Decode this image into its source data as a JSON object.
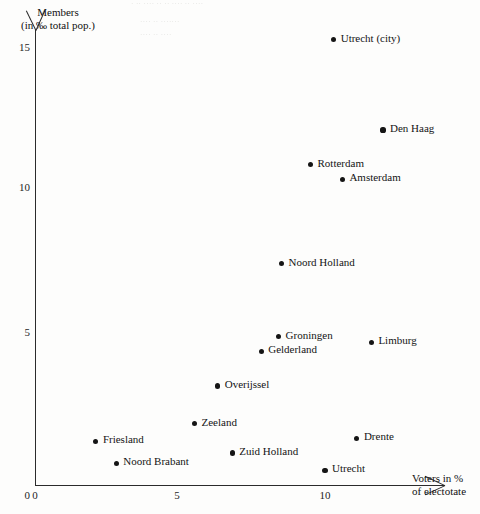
{
  "figure": {
    "background_color": "#fdfdfc",
    "ink_color": "#151515",
    "bleed_through_lines": [
      "· ·· ···· ·· ·· ···· ·· ····",
      "···· ·· ·······",
      "···· ·· ····"
    ]
  },
  "axes": {
    "y": {
      "title_line1": "Members",
      "title_line2": "(in ‰ total pop.)",
      "ticks": [
        "0",
        "5",
        "10",
        "15"
      ],
      "range": [
        0,
        15.8
      ]
    },
    "x": {
      "title_line1": "Voters in %",
      "title_line2": "of electotate",
      "ticks": [
        "0",
        "5",
        "10"
      ],
      "range": [
        0,
        14.1
      ]
    }
  },
  "chart_data": {
    "type": "scatter",
    "title": "",
    "xlabel": "Voters in % of electotate",
    "ylabel": "Members (in ‰ total pop.)",
    "xlim": [
      0,
      14.1
    ],
    "ylim": [
      0,
      15.8
    ],
    "xticks": [
      0,
      5,
      10
    ],
    "yticks": [
      0,
      5,
      10,
      15
    ],
    "grid": false,
    "legend": "none",
    "label_position": "right-of-point",
    "points": [
      {
        "label": "Utrecht (city)",
        "x": 10.3,
        "y": 15.3
      },
      {
        "label": "Den Haag",
        "x": 12.0,
        "y": 12.2
      },
      {
        "label": "Rotterdam",
        "x": 9.5,
        "y": 11.0
      },
      {
        "label": "Amsterdam",
        "x": 10.6,
        "y": 10.5
      },
      {
        "label": "Noord Holland",
        "x": 8.5,
        "y": 7.6
      },
      {
        "label": "Groningen",
        "x": 8.4,
        "y": 5.1
      },
      {
        "label": "Limburg",
        "x": 11.6,
        "y": 4.9
      },
      {
        "label": "Gelderland",
        "x": 7.8,
        "y": 4.6
      },
      {
        "label": "Overijssel",
        "x": 6.3,
        "y": 3.4
      },
      {
        "label": "Zeeland",
        "x": 5.5,
        "y": 2.1
      },
      {
        "label": "Drente",
        "x": 11.1,
        "y": 1.6
      },
      {
        "label": "Friesland",
        "x": 2.1,
        "y": 1.5
      },
      {
        "label": "Zuid Holland",
        "x": 6.8,
        "y": 1.1
      },
      {
        "label": "Noord Brabant",
        "x": 2.8,
        "y": 0.75
      },
      {
        "label": "Utrecht",
        "x": 10.0,
        "y": 0.5
      }
    ]
  }
}
